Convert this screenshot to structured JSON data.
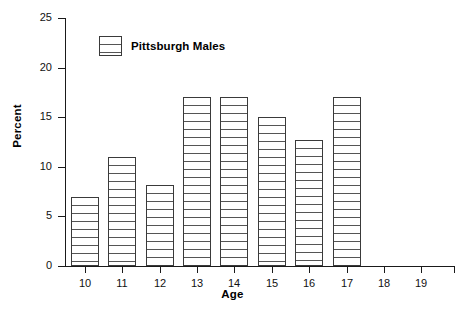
{
  "chart_data": {
    "type": "bar",
    "title": "",
    "xlabel": "Age",
    "ylabel": "Percent",
    "categories": [
      "10",
      "11",
      "12",
      "13",
      "14",
      "15",
      "16",
      "17",
      "18",
      "19"
    ],
    "values": [
      7.0,
      11.0,
      8.2,
      17.0,
      17.0,
      15.0,
      12.7,
      17.0,
      0,
      0
    ],
    "series": [
      {
        "name": "Pittsburgh Males",
        "values": [
          7.0,
          11.0,
          8.2,
          17.0,
          17.0,
          15.0,
          12.7,
          17.0,
          0,
          0
        ]
      }
    ],
    "xlim": [
      9.5,
      19.9
    ],
    "ylim": [
      0,
      25
    ],
    "ytick_labels": [
      "0",
      "5",
      "10",
      "15",
      "20",
      "25"
    ],
    "ytick_values": [
      0,
      5,
      10,
      15,
      20,
      25
    ],
    "xtick_labels": [
      "10",
      "11",
      "12",
      "13",
      "14",
      "15",
      "16",
      "17",
      "18",
      "19"
    ],
    "grid": false,
    "legend_position": "upper-left-inside",
    "bar_fill": "horizontal-hatch",
    "bar_edge_color": "#3a3a3a",
    "axis_color": "#1a1a1a",
    "background_color": "#ffffff"
  },
  "legend": {
    "entries": [
      {
        "label": "Pittsburgh Males",
        "swatch_name": "legend-swatch-pittsburgh-males"
      }
    ]
  },
  "axes": {
    "y_title": "Percent",
    "x_title": "Age"
  }
}
